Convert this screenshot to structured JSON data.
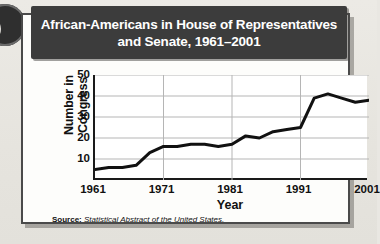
{
  "panel": {
    "title": "African-Americans in House of Representatives and Senate, 1961–2001",
    "source_label": "Source:",
    "source_text": "Statistical Abstract of the United States.",
    "title_bg": "#3c3c3c",
    "title_color": "#ffffff",
    "line_color": "#111111",
    "grid_color": "#b5b5b5"
  },
  "decor": {
    "binder_ring": "binder-ring"
  },
  "chart_data": {
    "type": "line",
    "title": "African-Americans in House of Representatives and Senate, 1961–2001",
    "xlabel": "Year",
    "ylabel": "Number in Congress",
    "xlim": [
      1961,
      2001
    ],
    "ylim": [
      0,
      50
    ],
    "ytick_labels": [
      "10",
      "20",
      "30",
      "40",
      "50"
    ],
    "yticks": [
      10,
      20,
      30,
      40,
      50
    ],
    "xtick_labels": [
      "1961",
      "1971",
      "1981",
      "1991",
      "2001"
    ],
    "xticks": [
      1961,
      1971,
      1981,
      1991,
      2001
    ],
    "grid": "horizontal-and-vertical",
    "legend": "none",
    "series": [
      {
        "name": "African-Americans in Congress",
        "x": [
          1961,
          1963,
          1965,
          1967,
          1969,
          1971,
          1973,
          1975,
          1977,
          1979,
          1981,
          1983,
          1985,
          1987,
          1989,
          1991,
          1993,
          1995,
          1997,
          1999,
          2001
        ],
        "values": [
          5,
          6,
          6,
          7,
          13,
          16,
          16,
          17,
          17,
          16,
          17,
          21,
          20,
          23,
          24,
          25,
          39,
          41,
          39,
          37,
          38
        ]
      }
    ]
  }
}
